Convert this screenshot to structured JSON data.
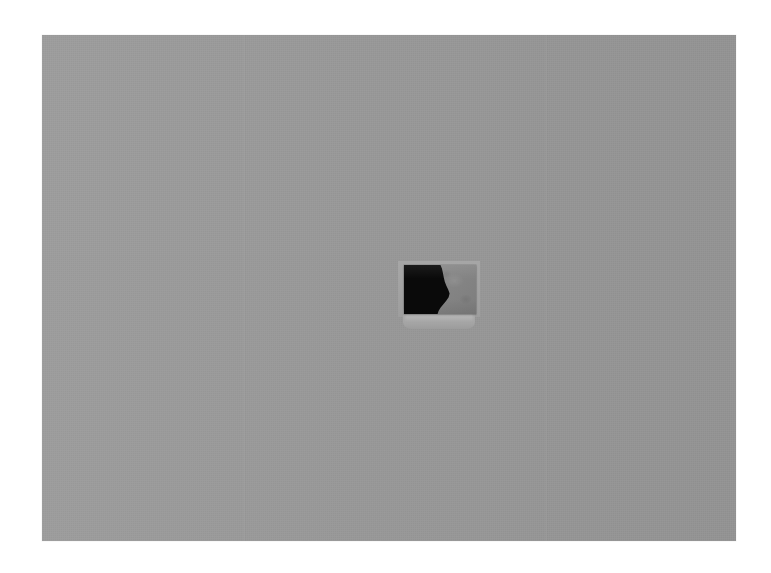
{
  "artwork": {
    "medium_surface_label": "grey canvas field",
    "frame_border_color": "#ffffff",
    "canvas_color": "#9a9a9a",
    "canvas_left": 42,
    "canvas_top": 35,
    "canvas_width": 694,
    "canvas_height": 506,
    "seams": [
      {
        "name": "left-seam",
        "x": 203
      },
      {
        "name": "right-seam",
        "x": 505
      }
    ],
    "object": {
      "name": "mounted-square-panel",
      "left": 362,
      "top": 230,
      "width": 72,
      "height": 49,
      "black_region_color": "#0a0a0a",
      "grey_region_color": "#878787",
      "backing_plate_color": "#a4a4a4",
      "shelf_color": "#a6a6a6",
      "shelf_top": 274,
      "shelf_height": 20,
      "description": "small square panel, left half black, right half mid-grey, with lighter backing plate and rounded shelf beneath"
    }
  },
  "caption": {
    "title": "",
    "subtitle": ""
  }
}
